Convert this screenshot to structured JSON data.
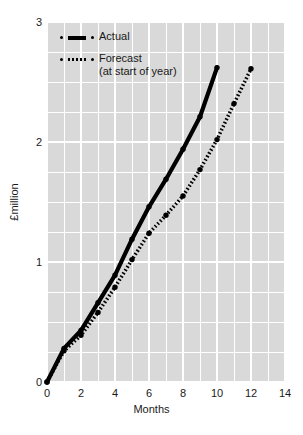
{
  "chart_data": {
    "type": "line",
    "title": "",
    "xlabel": "Months",
    "ylabel": "£million",
    "xlim": [
      0,
      14
    ],
    "ylim": [
      0,
      3
    ],
    "xticks": [
      0,
      2,
      4,
      6,
      8,
      10,
      12,
      14
    ],
    "yticks": [
      0,
      1,
      2,
      3
    ],
    "xtick_labels": [
      "0",
      "2",
      "4",
      "6",
      "8",
      "10",
      "12",
      "14"
    ],
    "ytick_labels": [
      "0",
      "1",
      "2",
      "3"
    ],
    "grid": true,
    "grid_color": "#ffffff",
    "plot_background": "#d9d9d9",
    "legend_position": "top-left",
    "series": [
      {
        "name": "Actual",
        "style": "solid",
        "color": "#000000",
        "x": [
          0,
          1,
          2,
          3,
          4,
          5,
          6,
          7,
          8,
          9,
          10
        ],
        "values": [
          0.0,
          0.28,
          0.43,
          0.66,
          0.89,
          1.19,
          1.46,
          1.69,
          1.94,
          2.21,
          2.62
        ]
      },
      {
        "name": "Forecast",
        "subtitle": "(at start of year)",
        "style": "dotted",
        "color": "#000000",
        "x": [
          0,
          1,
          2,
          3,
          4,
          5,
          6,
          7,
          8,
          9,
          10,
          11,
          12
        ],
        "values": [
          0.0,
          0.26,
          0.39,
          0.58,
          0.79,
          1.02,
          1.24,
          1.39,
          1.55,
          1.77,
          2.02,
          2.32,
          2.61
        ]
      }
    ]
  },
  "legend": {
    "entries": [
      {
        "label": "Actual",
        "sub": ""
      },
      {
        "label": "Forecast",
        "sub": "(at start of year)"
      }
    ]
  }
}
